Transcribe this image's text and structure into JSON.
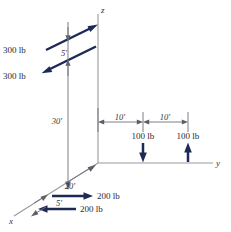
{
  "figure": {
    "type": "free-body-diagram",
    "background_color": "#ffffff",
    "force_color": "#1d2a56",
    "axis_color": "#9a9a9e",
    "dimension_color": "#6f6f78",
    "text_color": "#2a2a38"
  },
  "axes": [
    {
      "name": "z",
      "label": "z",
      "direction": "up"
    },
    {
      "name": "y",
      "label": "y",
      "direction": "right"
    },
    {
      "name": "x",
      "label": "x",
      "direction": "down-left"
    }
  ],
  "forces": [
    {
      "id": "force-300-upper",
      "label": "300 lb",
      "magnitude": 300,
      "unit": "lb",
      "direction": "up-right",
      "plane": "parallel to x-axis, upper"
    },
    {
      "id": "force-300-lower",
      "label": "300 lb",
      "magnitude": 300,
      "unit": "lb",
      "direction": "down-left",
      "plane": "parallel to x-axis, lower"
    },
    {
      "id": "force-100-left",
      "label": "100 lb",
      "magnitude": 100,
      "unit": "lb",
      "direction": "down",
      "plane": "vertical, on y-axis at 10 ft"
    },
    {
      "id": "force-100-right",
      "label": "100 lb",
      "magnitude": 100,
      "unit": "lb",
      "direction": "up",
      "plane": "vertical, on y-axis at 20 ft"
    },
    {
      "id": "force-200-upper",
      "label": "200 lb",
      "magnitude": 200,
      "unit": "lb",
      "direction": "right",
      "plane": "horizontal, near x-axis base, upper"
    },
    {
      "id": "force-200-lower",
      "label": "200 lb",
      "magnitude": 200,
      "unit": "lb",
      "direction": "left",
      "plane": "horizontal, near x-axis base, lower"
    }
  ],
  "dimensions": [
    {
      "id": "dim-5-top",
      "label": "5'",
      "value": 5,
      "unit": "ft",
      "between": "the two 300 lb forces",
      "orientation": "vertical"
    },
    {
      "id": "dim-30",
      "label": "30'",
      "value": 30,
      "unit": "ft",
      "between": "origin and upper 300 lb force",
      "orientation": "vertical"
    },
    {
      "id": "dim-10-left",
      "label": "10'",
      "value": 10,
      "unit": "ft",
      "between": "origin and first 100 lb force",
      "orientation": "horizontal"
    },
    {
      "id": "dim-10-right",
      "label": "10'",
      "value": 10,
      "unit": "ft",
      "between": "first and second 100 lb force",
      "orientation": "horizontal"
    },
    {
      "id": "dim-20",
      "label": "20'",
      "value": 20,
      "unit": "ft",
      "between": "origin and 200 lb force pair along x",
      "orientation": "diagonal"
    },
    {
      "id": "dim-5-bottom",
      "label": "5'",
      "value": 5,
      "unit": "ft",
      "between": "the two 200 lb forces",
      "orientation": "diagonal"
    }
  ]
}
